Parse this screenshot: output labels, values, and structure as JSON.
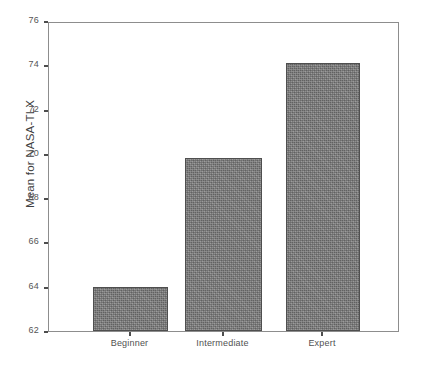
{
  "chart_data": {
    "type": "bar",
    "title": "",
    "subtitle": "",
    "xlabel": "",
    "ylabel": "Mean for NASA-TLX",
    "categories": [
      "Beginner",
      "Intermediate",
      "Expert"
    ],
    "values": [
      64.0,
      69.8,
      74.1
    ],
    "series": [
      {
        "name": "Mean for NASA-TLX",
        "values": [
          64.0,
          69.8,
          74.1
        ]
      }
    ],
    "ylim": [
      62,
      76
    ],
    "yticks": [
      62,
      64,
      66,
      68,
      70,
      72,
      74,
      76
    ],
    "ytick_labels": [
      "62",
      "64",
      "66",
      "68",
      "70",
      "72",
      "74",
      "76"
    ],
    "xtick_labels": [
      "Beginner",
      "Intermediate",
      "Expert"
    ],
    "grid": false,
    "legend": null,
    "legend_position": "none",
    "annotations": [],
    "colors": {
      "bar_fill": "#7e7e7e",
      "bar_edge": "#4f4f4f",
      "axis": "#8d8d8d",
      "tick_text": "#555555",
      "label_text": "#3f3f3f",
      "background": "#ffffff"
    }
  }
}
